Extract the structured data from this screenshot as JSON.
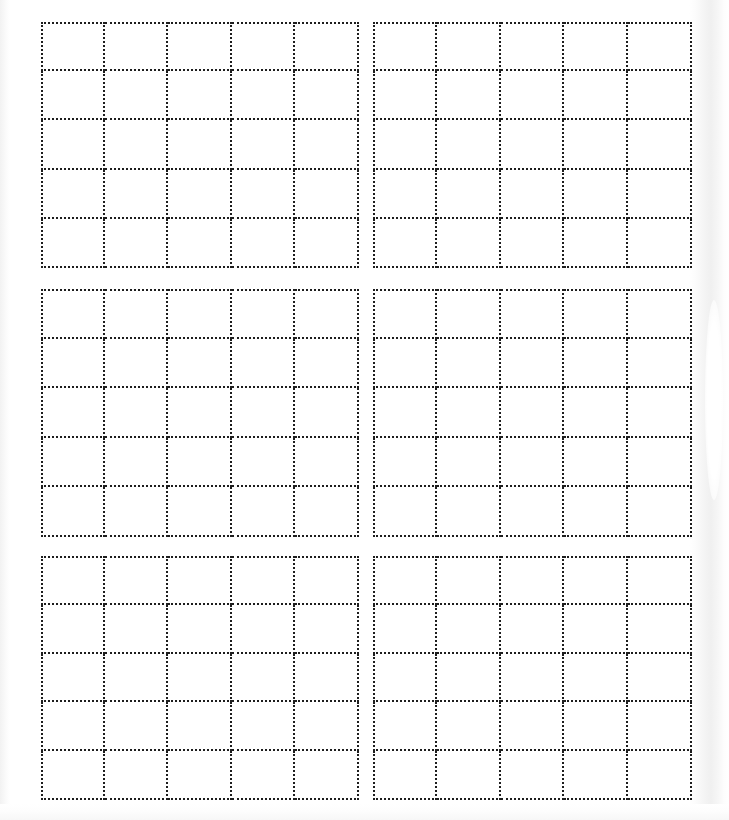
{
  "page": {
    "kind": "scanned-worksheet-page",
    "width_px": 729,
    "height_px": 820,
    "background_color": "#ffffff",
    "ink_color": "#1d1d1d",
    "border_style": "dotted",
    "border_width_px": 2,
    "visible_text": "",
    "notes_text": ""
  },
  "artifacts": {
    "left_edge_shadow_color": "#f2f2f2",
    "right_edge_shadow_color": "#f0f0f0",
    "bottom_edge_shadow_color": "#f7f7f7"
  },
  "layout": {
    "block_rows": 3,
    "block_cols": 2,
    "total_blocks": 6,
    "cell_rows_per_block": 5,
    "cell_cols_per_block": 5,
    "total_cells": 150
  },
  "blocks": [
    {
      "id": "block-0",
      "name": "grid-block-top-left",
      "position": "top-left",
      "rows": 5,
      "cols": 5,
      "x": 41,
      "y": 22,
      "width": 318,
      "height": 246,
      "cells": [
        [
          "",
          "",
          "",
          "",
          ""
        ],
        [
          "",
          "",
          "",
          "",
          ""
        ],
        [
          "",
          "",
          "",
          "",
          ""
        ],
        [
          "",
          "",
          "",
          "",
          ""
        ],
        [
          "",
          "",
          "",
          "",
          ""
        ]
      ]
    },
    {
      "id": "block-1",
      "name": "grid-block-top-right",
      "position": "top-right",
      "rows": 5,
      "cols": 5,
      "x": 373,
      "y": 22,
      "width": 319,
      "height": 246,
      "cells": [
        [
          "",
          "",
          "",
          "",
          ""
        ],
        [
          "",
          "",
          "",
          "",
          ""
        ],
        [
          "",
          "",
          "",
          "",
          ""
        ],
        [
          "",
          "",
          "",
          "",
          ""
        ],
        [
          "",
          "",
          "",
          "",
          ""
        ]
      ]
    },
    {
      "id": "block-2",
      "name": "grid-block-middle-left",
      "position": "middle-left",
      "rows": 5,
      "cols": 5,
      "x": 41,
      "y": 289,
      "width": 318,
      "height": 248,
      "cells": [
        [
          "",
          "",
          "",
          "",
          ""
        ],
        [
          "",
          "",
          "",
          "",
          ""
        ],
        [
          "",
          "",
          "",
          "",
          ""
        ],
        [
          "",
          "",
          "",
          "",
          ""
        ],
        [
          "",
          "",
          "",
          "",
          ""
        ]
      ]
    },
    {
      "id": "block-3",
      "name": "grid-block-middle-right",
      "position": "middle-right",
      "rows": 5,
      "cols": 5,
      "x": 373,
      "y": 289,
      "width": 319,
      "height": 248,
      "cells": [
        [
          "",
          "",
          "",
          "",
          ""
        ],
        [
          "",
          "",
          "",
          "",
          ""
        ],
        [
          "",
          "",
          "",
          "",
          ""
        ],
        [
          "",
          "",
          "",
          "",
          ""
        ],
        [
          "",
          "",
          "",
          "",
          ""
        ]
      ]
    },
    {
      "id": "block-4",
      "name": "grid-block-bottom-left",
      "position": "bottom-left",
      "rows": 5,
      "cols": 5,
      "x": 41,
      "y": 556,
      "width": 318,
      "height": 244,
      "cells": [
        [
          "",
          "",
          "",
          "",
          ""
        ],
        [
          "",
          "",
          "",
          "",
          ""
        ],
        [
          "",
          "",
          "",
          "",
          ""
        ],
        [
          "",
          "",
          "",
          "",
          ""
        ],
        [
          "",
          "",
          "",
          "",
          ""
        ]
      ]
    },
    {
      "id": "block-5",
      "name": "grid-block-bottom-right",
      "position": "bottom-right",
      "rows": 5,
      "cols": 5,
      "x": 373,
      "y": 556,
      "width": 319,
      "height": 244,
      "cells": [
        [
          "",
          "",
          "",
          "",
          ""
        ],
        [
          "",
          "",
          "",
          "",
          ""
        ],
        [
          "",
          "",
          "",
          "",
          ""
        ],
        [
          "",
          "",
          "",
          "",
          ""
        ],
        [
          "",
          "",
          "",
          "",
          ""
        ]
      ]
    }
  ]
}
